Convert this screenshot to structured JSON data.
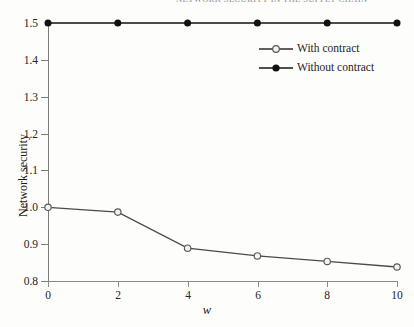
{
  "figure": {
    "running_head": "NETWORK SECURITY IN THE SUPPLY CHAIN",
    "background_color": "#fdfdfb"
  },
  "chart_data": {
    "type": "line",
    "title": "",
    "xlabel": "w",
    "ylabel": "Network security",
    "x": [
      0,
      2,
      4,
      6,
      8,
      10
    ],
    "xlim": [
      0,
      10
    ],
    "ylim": [
      0.8,
      1.5
    ],
    "xticks": [
      "0",
      "2",
      "4",
      "6",
      "8",
      "10"
    ],
    "yticks": [
      "0.8",
      "0.9",
      "1.0",
      "1.1",
      "1.2",
      "1.3",
      "1.4",
      "1.5"
    ],
    "ytick_values": [
      0.8,
      0.9,
      1.0,
      1.1,
      1.2,
      1.3,
      1.4,
      1.5
    ],
    "grid": false,
    "legend_position": "upper right inside",
    "series": [
      {
        "name": "With contract",
        "marker": "open-circle",
        "color": "#4a4a4a",
        "marker_fill": "#f2f2f0",
        "values": [
          1.0,
          0.987,
          0.889,
          0.868,
          0.853,
          0.838
        ]
      },
      {
        "name": "Without contract",
        "marker": "filled-circle",
        "color": "#111111",
        "marker_fill": "#111111",
        "values": [
          1.5,
          1.5,
          1.5,
          1.5,
          1.5,
          1.5
        ]
      }
    ]
  }
}
